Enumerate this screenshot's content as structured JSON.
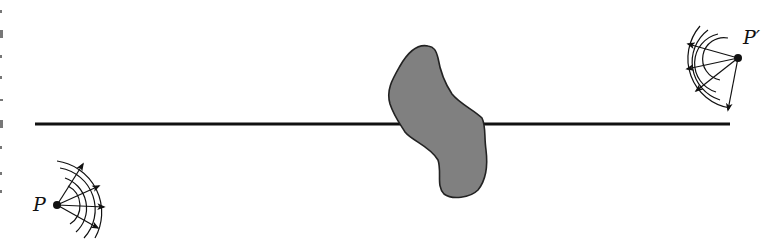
{
  "diagram": {
    "labels": {
      "source": "P",
      "image": "P′"
    },
    "colors": {
      "line": "#111111",
      "obstacle_fill": "#808080",
      "obstacle_stroke": "#222222",
      "ink": "#111111",
      "background": "#ffffff"
    },
    "elements": {
      "horizontal_line": {
        "x1": 35,
        "x2": 730,
        "y": 124
      },
      "source_point": {
        "x": 57,
        "y": 205
      },
      "image_point": {
        "x": 738,
        "y": 58
      },
      "obstacle": {
        "approx_bbox": [
          388,
          44,
          490,
          200
        ]
      }
    }
  }
}
